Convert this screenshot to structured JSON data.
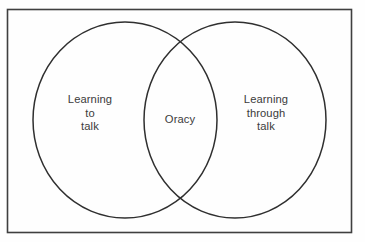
{
  "canvas": {
    "width": 365,
    "height": 242,
    "background_color": "#fefefe",
    "border_color": "#3f3f3f"
  },
  "frame": {
    "name": "outer-border-rectangle",
    "x": 7.5,
    "y": 9.5,
    "width": 344,
    "height": 223,
    "stroke_width": 1.6
  },
  "diagram": {
    "type": "venn",
    "sets": 2,
    "stroke_color": "#2f2f2f",
    "stroke_width": 1.5,
    "fill": "none",
    "circles": [
      {
        "id": "left-circle",
        "label": "Learning\nto\ntalk",
        "cx": 125,
        "cy": 120,
        "rx": 92,
        "ry": 98
      },
      {
        "id": "right-circle",
        "label": "Learning\nthrough\ntalk",
        "cx": 235,
        "cy": 120,
        "rx": 91,
        "ry": 98
      }
    ],
    "intersection": {
      "id": "intersection-region",
      "label": "Oracy",
      "cx": 180,
      "cy": 120
    }
  },
  "labels": {
    "left": "Learning\nto\ntalk",
    "center": "Oracy",
    "right": "Learning\nthrough\ntalk",
    "text_color": "#3b3b3b",
    "font_size_px": 11.2
  }
}
